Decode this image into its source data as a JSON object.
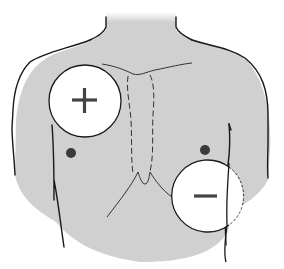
{
  "diagram": {
    "title": "Defibrillator pad placement on chest",
    "colors": {
      "background": "#ffffff",
      "skin_fill": "#d0d0d0",
      "outline": "#1a1a1a",
      "pad_fill": "#ffffff",
      "symbol": "#444444"
    },
    "pads": [
      {
        "id": "positive",
        "symbol": "+",
        "position": "upper right chest (patient's right)",
        "cx": 85,
        "cy": 101,
        "r": 36
      },
      {
        "id": "negative",
        "symbol": "−",
        "position": "lower left chest, side (patient's left)",
        "cx": 207,
        "cy": 196,
        "r": 36,
        "partially_dashed": true
      }
    ]
  }
}
